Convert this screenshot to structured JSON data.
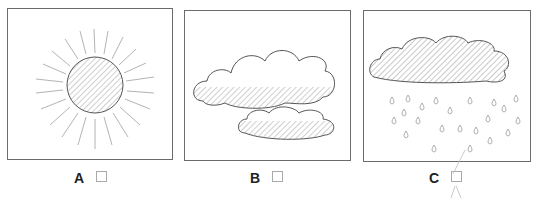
{
  "options": [
    {
      "letter": "A",
      "picture": "sunny",
      "checked": false
    },
    {
      "letter": "B",
      "picture": "cloudy",
      "checked": false
    },
    {
      "letter": "C",
      "picture": "rainy",
      "checked": true
    }
  ],
  "colors": {
    "outline": "#6b6b6b",
    "hatch": "#888888",
    "label": "#222222"
  }
}
